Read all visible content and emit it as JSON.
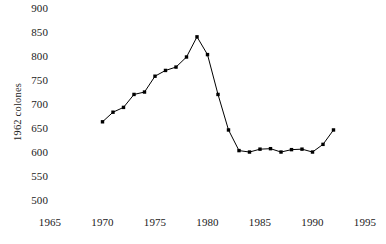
{
  "chart_data": {
    "type": "line",
    "title": "",
    "subtitle": "",
    "xlabel": "",
    "ylabel": "1962 colones",
    "xlim": [
      1965,
      1995
    ],
    "ylim": [
      500,
      900
    ],
    "xticks": [
      1965,
      1970,
      1975,
      1980,
      1985,
      1990,
      1995
    ],
    "yticks": [
      500,
      550,
      600,
      650,
      700,
      750,
      800,
      850,
      900
    ],
    "xtick_labels": [
      "1965",
      "1970",
      "1975",
      "1980",
      "1985",
      "1990",
      "1995"
    ],
    "ytick_labels": [
      "500",
      "550",
      "600",
      "650",
      "700",
      "750",
      "800",
      "850",
      "900"
    ],
    "grid": false,
    "legend": null,
    "legend_position": "none",
    "marker": "square",
    "marker_color": "#000000",
    "line_color": "#000000",
    "x": [
      1970,
      1971,
      1972,
      1973,
      1974,
      1975,
      1976,
      1977,
      1978,
      1979,
      1980,
      1981,
      1982,
      1983,
      1984,
      1985,
      1986,
      1987,
      1988,
      1989,
      1990,
      1991,
      1992
    ],
    "values": [
      665,
      685,
      695,
      722,
      727,
      760,
      772,
      779,
      800,
      842,
      805,
      722,
      648,
      605,
      602,
      608,
      609,
      602,
      607,
      608,
      602,
      618,
      648
    ],
    "series": [
      {
        "name": "1962 colones",
        "x": [
          1970,
          1971,
          1972,
          1973,
          1974,
          1975,
          1976,
          1977,
          1978,
          1979,
          1980,
          1981,
          1982,
          1983,
          1984,
          1985,
          1986,
          1987,
          1988,
          1989,
          1990,
          1991,
          1992
        ],
        "values": [
          665,
          685,
          695,
          722,
          727,
          760,
          772,
          779,
          800,
          842,
          805,
          722,
          648,
          605,
          602,
          608,
          609,
          602,
          607,
          608,
          602,
          618,
          648
        ]
      }
    ],
    "annotations": []
  },
  "axis": {
    "y_axis_title": "1962 colones"
  }
}
